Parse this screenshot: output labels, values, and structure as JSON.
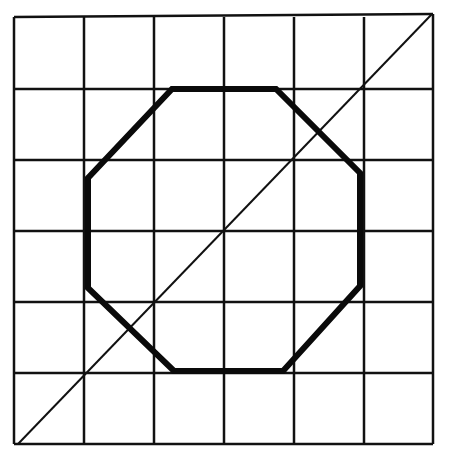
{
  "figure": {
    "grid": {
      "columns": 6,
      "rows": 6,
      "x_lines": [
        14,
        84,
        154,
        224,
        294,
        364,
        433
      ],
      "y_lines": [
        17,
        89,
        160,
        231,
        302,
        373,
        444
      ],
      "stroke": "#111111",
      "stroke_width": 2.5
    },
    "octagon": {
      "points": [
        [
          172,
          89
        ],
        [
          276,
          89
        ],
        [
          360,
          173
        ],
        [
          360,
          286
        ],
        [
          283,
          371
        ],
        [
          174,
          371
        ],
        [
          88,
          288
        ],
        [
          88,
          178
        ]
      ],
      "stroke": "#0a0a0a",
      "stroke_width": 6
    },
    "diagonal": {
      "from": [
        18,
        444
      ],
      "to": [
        432,
        14
      ],
      "stroke": "#111111",
      "stroke_width": 2
    }
  }
}
